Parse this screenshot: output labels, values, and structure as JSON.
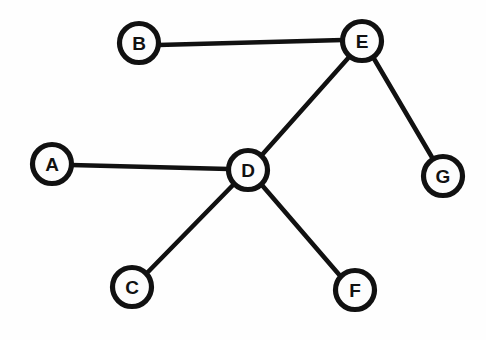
{
  "diagram": {
    "type": "node-link-graph",
    "background_color": "#fefefe",
    "stroke_color": "#111111",
    "node_fill_color": "#fdfdfd",
    "node_radius": 19.5,
    "node_stroke_width": 5.2,
    "edge_stroke_width": 4.6,
    "width": 486,
    "height": 340,
    "nodes": [
      {
        "id": "A",
        "label": "A",
        "x": 52,
        "y": 164
      },
      {
        "id": "B",
        "label": "B",
        "x": 139,
        "y": 43
      },
      {
        "id": "C",
        "label": "C",
        "x": 132,
        "y": 287
      },
      {
        "id": "D",
        "label": "D",
        "x": 248,
        "y": 170
      },
      {
        "id": "E",
        "label": "E",
        "x": 362,
        "y": 41
      },
      {
        "id": "F",
        "label": "F",
        "x": 355,
        "y": 290
      },
      {
        "id": "G",
        "label": "G",
        "x": 443,
        "y": 176
      }
    ],
    "edges": [
      {
        "id": "B-E",
        "source": "B",
        "target": "E",
        "x1": 158,
        "y1": 45,
        "x2": 343,
        "y2": 40
      },
      {
        "id": "A-D",
        "source": "A",
        "target": "D",
        "x1": 71,
        "y1": 165,
        "x2": 229,
        "y2": 169
      },
      {
        "id": "D-E",
        "source": "D",
        "target": "E",
        "x1": 261,
        "y1": 156,
        "x2": 350,
        "y2": 56
      },
      {
        "id": "E-G",
        "source": "E",
        "target": "G",
        "x1": 373,
        "y1": 57,
        "x2": 433,
        "y2": 159
      },
      {
        "id": "D-C",
        "source": "D",
        "target": "C",
        "x1": 235,
        "y1": 183,
        "x2": 145,
        "y2": 275
      },
      {
        "id": "D-F",
        "source": "D",
        "target": "F",
        "x1": 261,
        "y1": 184,
        "x2": 342,
        "y2": 278
      }
    ]
  }
}
